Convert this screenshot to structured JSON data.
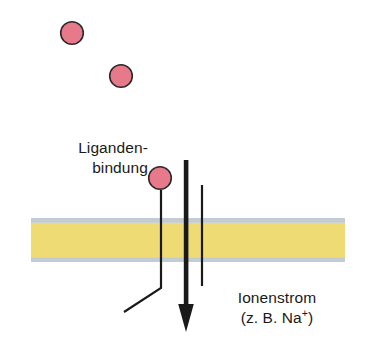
{
  "figure": {
    "background_color": "#ffffff",
    "width": 366,
    "height": 357
  },
  "colors": {
    "ligand_fill": "#e8798a",
    "ligand_stroke": "#2b2b2b",
    "membrane_core": "#efdb74",
    "membrane_edge": "#c3cbd4",
    "line": "#1a1a1a",
    "text": "#1a1a1a"
  },
  "labels": {
    "ligand_binding": {
      "line1": "Liganden-",
      "line2": "bindung"
    },
    "ion_current": {
      "line1": "Ionenstrom",
      "line2_prefix": "(z. B. Na",
      "line2_sup": "+",
      "line2_suffix": ")"
    }
  },
  "elements": {
    "membrane": {
      "name": "lipid-bilayer-membrane",
      "x": 31,
      "y": 218,
      "width": 314,
      "height": 44,
      "edge_thickness": 4.5
    },
    "ligands": [
      {
        "name": "ligand-molecule-1",
        "cx": 72,
        "cy": 33,
        "r": 11.5,
        "state": "free"
      },
      {
        "name": "ligand-molecule-2",
        "cx": 121,
        "cy": 76,
        "r": 11.5,
        "state": "free"
      },
      {
        "name": "ligand-molecule-3",
        "cx": 160,
        "cy": 178,
        "r": 11.5,
        "state": "bound"
      }
    ],
    "receptor_channel_wall_left": {
      "name": "channel-wall-left",
      "x": 161,
      "y_top": 190,
      "y_bend": 288,
      "foot_x": 124,
      "foot_y": 312,
      "stroke_width": 2.2
    },
    "channel_wall_right": {
      "name": "channel-wall-right",
      "x": 202,
      "y_top": 185,
      "y_bottom": 286,
      "stroke_width": 2.2
    },
    "ion_flow_arrow": {
      "name": "ion-flow-arrow",
      "x": 186,
      "y_top": 160,
      "y_tip": 332,
      "shaft_width": 4.5,
      "head_width": 16,
      "head_length": 26,
      "direction": "down"
    }
  }
}
